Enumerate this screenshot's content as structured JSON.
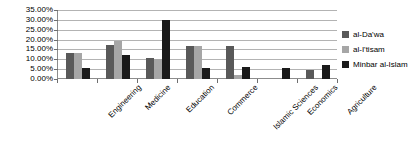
{
  "chart_data": {
    "type": "bar",
    "title": "",
    "subtitle": "",
    "xlabel": "",
    "ylabel": "",
    "grid": true,
    "legend_position": "right",
    "ylim": [
      0,
      35
    ],
    "ytick_labels": [
      "35.00%",
      "30.00%",
      "25.00%",
      "20.00%",
      "15.00%",
      "10.00%",
      "5.00%",
      "0.00%"
    ],
    "ytick_values": [
      35,
      30,
      25,
      20,
      15,
      10,
      5,
      0
    ],
    "categories": [
      "Engineering",
      "Medicine",
      "Education",
      "Commerce",
      "Islamic Sciences",
      "Economics",
      "Agriculture"
    ],
    "series": [
      {
        "name": "al-Da'wa",
        "color": "#595959",
        "values": [
          13.0,
          17.5,
          10.5,
          16.5,
          17.0,
          0.0,
          4.5
        ]
      },
      {
        "name": "al-I'tisam",
        "color": "#a6a6a6",
        "values": [
          13.0,
          19.5,
          10.0,
          16.5,
          2.0,
          0.0,
          0.0
        ]
      },
      {
        "name": "Minbar al-Islam",
        "color": "#1a1a1a",
        "values": [
          5.5,
          12.0,
          30.0,
          5.5,
          6.0,
          5.5,
          7.0
        ]
      }
    ]
  },
  "axis": {
    "baseline_color": "#8c8c8c",
    "gridline_color": "#b3b3b3"
  }
}
